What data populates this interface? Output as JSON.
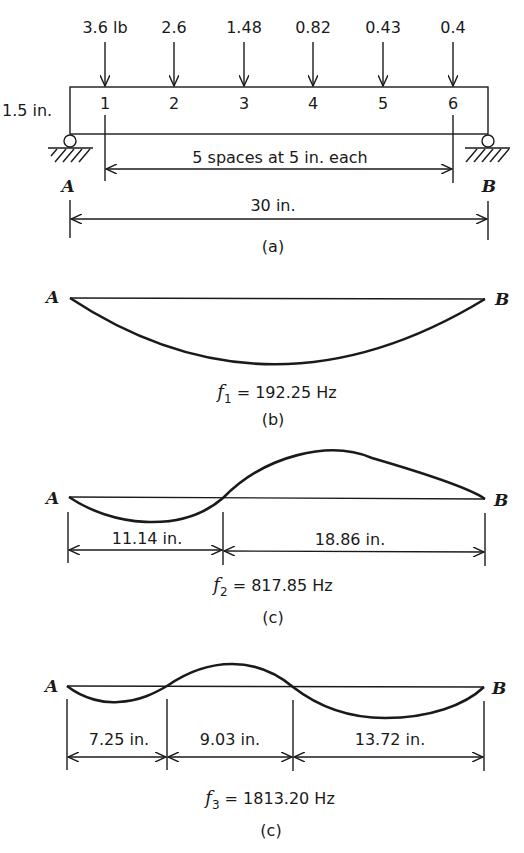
{
  "figure": {
    "part_a": {
      "loads": [
        {
          "station": "1",
          "value": "3.6 lb"
        },
        {
          "station": "2",
          "value": "2.6"
        },
        {
          "station": "3",
          "value": "1.48"
        },
        {
          "station": "4",
          "value": "0.82"
        },
        {
          "station": "5",
          "value": "0.43"
        },
        {
          "station": "6",
          "value": "0.4"
        }
      ],
      "beam_depth": "1.5 in.",
      "spacing_label": "5 spaces at 5 in. each",
      "span_label": "30 in.",
      "support_left": "A",
      "support_right": "B",
      "caption": "(a)"
    },
    "part_b": {
      "left": "A",
      "right": "B",
      "freq_symbol": "f",
      "freq_sub": "1",
      "freq_value": " = 192.25 Hz",
      "caption": "(b)"
    },
    "part_c": {
      "left": "A",
      "right": "B",
      "segments": [
        "11.14 in.",
        "18.86 in."
      ],
      "freq_symbol": "f",
      "freq_sub": "2",
      "freq_value": " = 817.85 Hz",
      "caption": "(c)"
    },
    "part_d": {
      "left": "A",
      "right": "B",
      "segments": [
        "7.25 in.",
        "9.03 in.",
        "13.72 in."
      ],
      "freq_symbol": "f",
      "freq_sub": "3",
      "freq_value": " = 1813.20 Hz",
      "caption": "(c)"
    }
  }
}
